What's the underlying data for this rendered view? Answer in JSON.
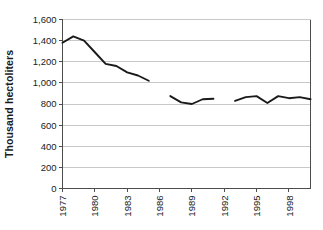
{
  "chart_data": {
    "type": "line",
    "title": "",
    "subtitle": "",
    "xlabel": "",
    "ylabel": "Thousand hectoliters",
    "ylim": [
      0,
      1600
    ],
    "xlim": [
      1977,
      2000
    ],
    "grid": true,
    "legend": false,
    "y_ticks": [
      0,
      200,
      400,
      600,
      800,
      1000,
      1200,
      1400,
      1600
    ],
    "y_tick_labels": [
      "0",
      "200",
      "400",
      "600",
      "800",
      "1,000",
      "1,200",
      "1,400",
      "1,600"
    ],
    "x_ticks": [
      1977,
      1980,
      1983,
      1986,
      1989,
      1992,
      1995,
      1998
    ],
    "x_tick_labels": [
      "1977",
      "1980",
      "1983",
      "1986",
      "1989",
      "1992",
      "1995",
      "1998"
    ],
    "line_color": "#1a1a1a",
    "grid_color": "#c8c8c8",
    "axis_color": "#4d4d4d",
    "series": [
      {
        "name": "Production",
        "segments": [
          {
            "x": [
              1977,
              1978,
              1979,
              1980,
              1981,
              1982,
              1983,
              1984,
              1985
            ],
            "y": [
              1380,
              1440,
              1400,
              1290,
              1180,
              1160,
              1100,
              1070,
              1020
            ]
          },
          {
            "x": [
              1987,
              1988,
              1989,
              1990,
              1991
            ],
            "y": [
              875,
              815,
              800,
              845,
              850
            ]
          },
          {
            "x": [
              1993,
              1994,
              1995,
              1996,
              1997,
              1998,
              1999,
              2000
            ],
            "y": [
              830,
              865,
              875,
              810,
              875,
              855,
              865,
              845
            ]
          }
        ]
      }
    ]
  }
}
